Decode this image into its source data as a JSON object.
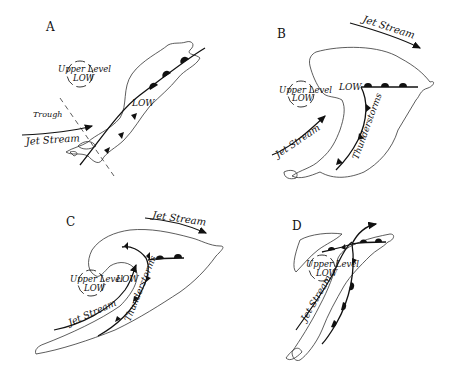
{
  "panels": [
    {
      "id": "A",
      "labels": {
        "upper_level_line1": "Upper Level",
        "upper_level_line2": "LOW",
        "trough": "Trough",
        "jet_stream": "Jet Stream",
        "low": "LOW"
      }
    },
    {
      "id": "B",
      "labels": {
        "jet_stream_top": "Jet Stream",
        "upper_level_line1": "Upper Level",
        "upper_level_line2": "LOW",
        "low": "LOW",
        "jet_stream_left": "Jet Stream",
        "thunderstorms": "Thunderstorms"
      }
    },
    {
      "id": "C",
      "labels": {
        "jet_stream_top": "Jet Stream",
        "upper_level_line1": "Upper Level",
        "upper_level_line2": "LOW",
        "low": "LOW",
        "jet_stream_left": "Jet Stream",
        "thunderstorms": "Thunderstorms"
      }
    },
    {
      "id": "D",
      "labels": {
        "upper_level_line1": "Upper Level",
        "upper_level_line2": "LOW",
        "jet_stream": "Jet Stream"
      }
    }
  ],
  "colors": {
    "ink": "#111111",
    "background": "#ffffff"
  }
}
